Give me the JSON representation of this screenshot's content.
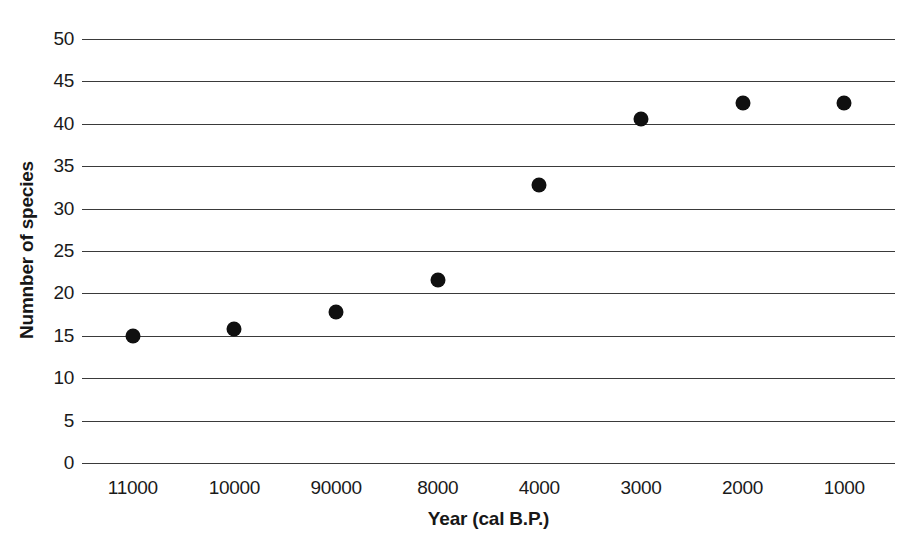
{
  "chart_data": {
    "type": "scatter",
    "title": "",
    "xlabel": "Year (cal B.P.)",
    "ylabel": "Numnber of species",
    "categories": [
      "11000",
      "10000",
      "90000",
      "8000",
      "4000",
      "3000",
      "2000",
      "1000"
    ],
    "values": [
      15.0,
      15.8,
      17.8,
      21.6,
      32.8,
      40.6,
      42.5,
      42.5
    ],
    "series": [
      {
        "name": "Number of species",
        "values": [
          15.0,
          15.8,
          17.8,
          21.6,
          32.8,
          40.6,
          42.5,
          42.5
        ]
      }
    ],
    "ylim": [
      0,
      50
    ],
    "yticks": [
      0,
      5,
      10,
      15,
      20,
      25,
      30,
      35,
      40,
      45,
      50
    ],
    "ytick_labels": [
      "0",
      "5",
      "10",
      "15",
      "20",
      "25",
      "30",
      "35",
      "40",
      "45",
      "50"
    ],
    "xtick_labels": [
      "11000",
      "10000",
      "90000",
      "8000",
      "4000",
      "3000",
      "2000",
      "1000"
    ],
    "grid": "horizontal",
    "legend": "none",
    "marker_color": "#101010",
    "gridline_color": "#3a3a3a",
    "background_color": "#ffffff",
    "text_color": "#1a1a1a",
    "points": [
      {
        "x_label": "11000",
        "y": 15.0
      },
      {
        "x_label": "10000",
        "y": 15.8
      },
      {
        "x_label": "90000",
        "y": 17.8
      },
      {
        "x_label": "8000",
        "y": 21.6
      },
      {
        "x_label": "4000",
        "y": 32.8
      },
      {
        "x_label": "3000",
        "y": 40.6
      },
      {
        "x_label": "2000",
        "y": 42.5
      },
      {
        "x_label": "1000",
        "y": 42.5
      }
    ]
  }
}
